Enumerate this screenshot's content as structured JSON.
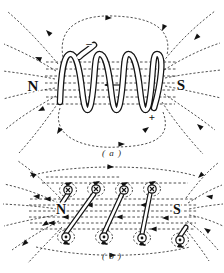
{
  "figure_a": {
    "north_label": "N",
    "south_label": "S",
    "negative_terminal": "–",
    "positive_terminal": "+",
    "caption": "( a )"
  },
  "figure_b": {
    "north_label": "N",
    "south_label": "S",
    "caption": "( b )"
  },
  "colors": {
    "ink": "#1c1c1c",
    "background": "#ffffff"
  },
  "icons": {
    "field_arrow": "solid-triangle-arrowhead",
    "current_out_symbol": "circle-dot",
    "current_in_symbol": "circle-cross"
  }
}
